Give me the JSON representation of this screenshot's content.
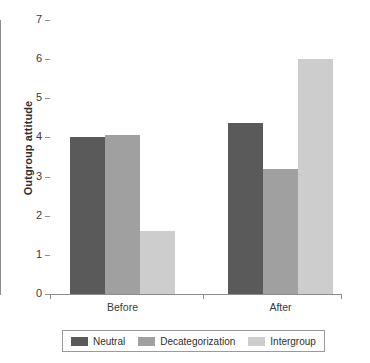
{
  "chart_data": {
    "type": "bar",
    "title": "",
    "xlabel": "",
    "ylabel": "Outgroup attitude",
    "categories": [
      "Before",
      "After"
    ],
    "series": [
      {
        "name": "Neutral",
        "color": "#5a5a5a",
        "values": [
          4.0,
          4.37
        ]
      },
      {
        "name": "Decategorization",
        "color": "#a0a0a0",
        "values": [
          4.05,
          3.2
        ]
      },
      {
        "name": "Intergroup",
        "color": "#cdcdcd",
        "values": [
          1.6,
          6.0
        ]
      }
    ],
    "ylim": [
      0,
      7
    ],
    "ytick_labels": [
      "0",
      "1",
      "2",
      "3",
      "4",
      "5",
      "6",
      "7"
    ],
    "ytick_values": [
      0,
      1,
      2,
      3,
      4,
      5,
      6,
      7
    ],
    "grid": false,
    "legend_position": "bottom",
    "legend_bordered": true,
    "background_color": "#ffffff",
    "axis_color": "#8d8d8d"
  }
}
